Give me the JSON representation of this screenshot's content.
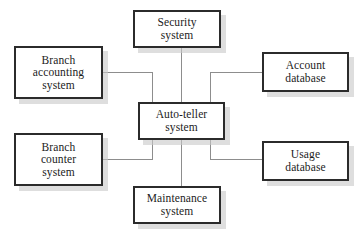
{
  "diagram": {
    "type": "block-diagram",
    "background_color": "#ffffff",
    "box_border_color": "#2b2b2b",
    "box_fill_color": "#ffffff",
    "shadow_color": "#c9c9c9",
    "line_color": "#8d8d8d",
    "center_node_id": "auto-teller-system",
    "nodes": [
      {
        "id": "security-system",
        "label": "Security\nsystem",
        "x": 133,
        "y": 10,
        "width": 88,
        "height": 38
      },
      {
        "id": "branch-accounting-system",
        "label": "Branch\naccounting\nsystem",
        "x": 14,
        "y": 46,
        "width": 89,
        "height": 53
      },
      {
        "id": "account-database",
        "label": "Account\ndatabase",
        "x": 262,
        "y": 52,
        "width": 87,
        "height": 40
      },
      {
        "id": "auto-teller-system",
        "label": "Auto-teller\nsystem",
        "x": 138,
        "y": 102,
        "width": 87,
        "height": 38
      },
      {
        "id": "branch-counter-system",
        "label": "Branch\ncounter\nsystem",
        "x": 14,
        "y": 133,
        "width": 89,
        "height": 53
      },
      {
        "id": "usage-database",
        "label": "Usage\ndatabase",
        "x": 262,
        "y": 141,
        "width": 87,
        "height": 40
      },
      {
        "id": "maintenance-system",
        "label": "Maintenance\nsystem",
        "x": 133,
        "y": 186,
        "width": 88,
        "height": 38
      }
    ],
    "connections": [
      {
        "id": "security-to-auto-teller",
        "from": "security-system",
        "to": "auto-teller-system",
        "route": "vertical"
      },
      {
        "id": "maintenance-to-auto-teller",
        "from": "maintenance-system",
        "to": "auto-teller-system",
        "route": "vertical"
      },
      {
        "id": "branch-accounting-to-auto-teller",
        "from": "branch-accounting-system",
        "to": "auto-teller-system",
        "route": "orthogonal-left"
      },
      {
        "id": "branch-counter-to-auto-teller",
        "from": "branch-counter-system",
        "to": "auto-teller-system",
        "route": "orthogonal-left"
      },
      {
        "id": "account-database-to-auto-teller",
        "from": "account-database",
        "to": "auto-teller-system",
        "route": "orthogonal-right"
      },
      {
        "id": "usage-database-to-auto-teller",
        "from": "usage-database",
        "to": "auto-teller-system",
        "route": "orthogonal-right"
      }
    ]
  }
}
